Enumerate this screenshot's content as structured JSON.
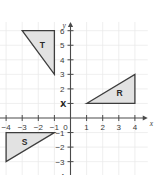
{
  "chart_data": {
    "type": "scatter",
    "title": "",
    "xlabel": "x",
    "ylabel": "y",
    "xlim": [
      -4.6,
      4.8
    ],
    "ylim": [
      -4.4,
      6.6
    ],
    "grid": true,
    "legend": "none",
    "x_ticks": [
      {
        "value": -4,
        "label": "−4"
      },
      {
        "value": -3,
        "label": "−3"
      },
      {
        "value": -2,
        "label": "−2"
      },
      {
        "value": -1,
        "label": "−1"
      },
      {
        "value": 1,
        "label": "1"
      },
      {
        "value": 2,
        "label": "2"
      },
      {
        "value": 3,
        "label": "3"
      },
      {
        "value": 4,
        "label": "4"
      }
    ],
    "y_ticks": [
      {
        "value": 6,
        "label": "6"
      },
      {
        "value": 5,
        "label": "5"
      },
      {
        "value": 4,
        "label": "4"
      },
      {
        "value": 3,
        "label": "3"
      },
      {
        "value": 2,
        "label": "2"
      },
      {
        "value": 1,
        "label": "1"
      },
      {
        "value": -1,
        "label": "−1"
      },
      {
        "value": -2,
        "label": "−2"
      },
      {
        "value": -3,
        "label": "−3"
      },
      {
        "value": -4,
        "label": "−4"
      }
    ],
    "origin_label": "0",
    "shapes": [
      {
        "name": "T",
        "label": "T",
        "vertices": [
          [
            -3,
            6
          ],
          [
            -1,
            6
          ],
          [
            -1,
            3
          ]
        ],
        "label_at": [
          -1.75,
          5.0
        ],
        "fill": "#e2e2e2",
        "stroke": "#3d3d3d"
      },
      {
        "name": "R",
        "label": "R",
        "vertices": [
          [
            1,
            1
          ],
          [
            4,
            3
          ],
          [
            4,
            1
          ]
        ],
        "label_at": [
          3.05,
          1.75
        ],
        "fill": "#e2e2e2",
        "stroke": "#3d3d3d"
      },
      {
        "name": "S",
        "label": "S",
        "vertices": [
          [
            -4,
            -1
          ],
          [
            -1,
            -1
          ],
          [
            -4,
            -3
          ]
        ],
        "label_at": [
          -2.85,
          -1.65
        ],
        "fill": "#e2e2e2",
        "stroke": "#3d3d3d"
      }
    ],
    "markers": [
      {
        "name": "X",
        "label": "X",
        "x": -0.45,
        "y": 1
      }
    ]
  }
}
